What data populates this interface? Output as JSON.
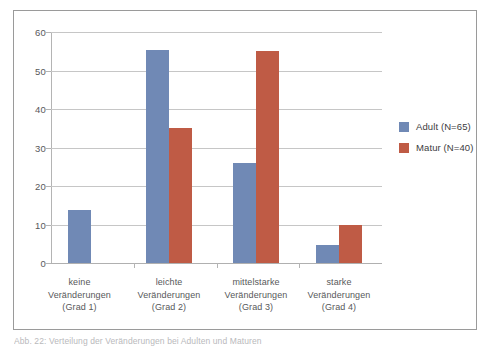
{
  "chart_data": {
    "type": "bar",
    "title": "",
    "subtitle": "",
    "xlabel": "",
    "ylabel": "",
    "ylim": [
      0,
      60
    ],
    "yticks": [
      0,
      10,
      20,
      30,
      40,
      50,
      60
    ],
    "grid": true,
    "legend_position": "right",
    "categories": [
      "keine Veränderungen (Grad 1)",
      "leichte Veränderungen (Grad 2)",
      "mittelstarke Veränderungen (Grad 3)",
      "starke Veränderungen (Grad 4)"
    ],
    "category_lines": [
      [
        "keine",
        "Veränderungen",
        "(Grad 1)"
      ],
      [
        "leichte",
        "Veränderungen",
        "(Grad 2)"
      ],
      [
        "mittelstarke",
        "Veränderungen",
        "(Grad 3)"
      ],
      [
        "starke",
        "Veränderungen",
        "(Grad 4)"
      ]
    ],
    "series": [
      {
        "name": "Adult (N=65)",
        "color": "#7089b5",
        "values": [
          13.8,
          55.3,
          26.1,
          4.6
        ]
      },
      {
        "name": "Matur (N=40)",
        "color": "#bf5b45",
        "values": [
          0,
          35.0,
          55.0,
          10.0
        ]
      }
    ]
  },
  "axis": {
    "y_tick_labels": [
      "60",
      "50",
      "40",
      "30",
      "20",
      "10",
      "0"
    ]
  },
  "legend": {
    "items": [
      {
        "label": "Adult (N=65)",
        "color": "#7089b5"
      },
      {
        "label": "Matur (N=40)",
        "color": "#bf5b45"
      }
    ]
  },
  "caption": {
    "text": "Abb. 22: Verteilung der Veränderungen bei Adulten und Maturen"
  },
  "colors": {
    "adult": "#7089b5",
    "matur": "#bf5b45",
    "grid": "#c6c6c6",
    "frame": "#9a9a9a",
    "text": "#58585a"
  }
}
